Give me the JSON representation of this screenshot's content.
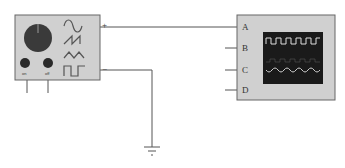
{
  "diagram": {
    "function_generator": {
      "plus_label": "+",
      "minus_label": "−",
      "button_labels": [
        "on",
        "off"
      ],
      "waveforms": [
        "sine",
        "sawtooth",
        "triangle",
        "square"
      ]
    },
    "oscilloscope": {
      "channels": [
        "A",
        "B",
        "C",
        "D"
      ],
      "screen_traces": [
        "square",
        "sine"
      ]
    },
    "connections": [
      {
        "from": "function_generator.+",
        "to": "oscilloscope.A"
      },
      {
        "from": "function_generator.−",
        "to": "ground"
      }
    ],
    "colors": {
      "panel": "#d0d0d0",
      "screen": "#1a1a1a",
      "wire": "#555555",
      "knob": "#3a3a3a"
    }
  }
}
